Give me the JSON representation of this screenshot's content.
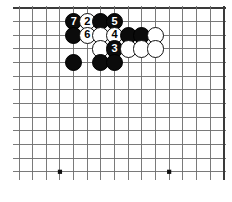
{
  "diagram": {
    "type": "go-board-corner-diagram",
    "caption": "",
    "board": {
      "columns": 16,
      "rows": 13,
      "origin_x": 19,
      "origin_y": 8,
      "spacing": 13.65,
      "line_color": "#6b6b6b",
      "edge_color": "#3a3a3a",
      "line_width": 0.9,
      "edge_width": 2.2,
      "background": "#ffffff",
      "star_points": [
        {
          "col": 3,
          "row": 12
        },
        {
          "col": 11,
          "row": 12
        }
      ],
      "star_radius": 2.1,
      "star_color": "#111111"
    },
    "stone_radius": 8.6,
    "colors": {
      "black": "#0b0b0b",
      "white": "#ffffff",
      "black_label": "#ffffff",
      "white_label": "#000000"
    },
    "stones": [
      {
        "col": 4,
        "row": 1,
        "color": "black",
        "label": "7"
      },
      {
        "col": 5,
        "row": 1,
        "color": "white",
        "label": "2"
      },
      {
        "col": 6,
        "row": 1,
        "color": "black",
        "label": ""
      },
      {
        "col": 7,
        "row": 1,
        "color": "black",
        "label": "5"
      },
      {
        "col": 4,
        "row": 2,
        "color": "black",
        "label": ""
      },
      {
        "col": 5,
        "row": 2,
        "color": "white",
        "label": "6"
      },
      {
        "col": 6,
        "row": 2,
        "color": "white",
        "label": ""
      },
      {
        "col": 7,
        "row": 2,
        "color": "white",
        "label": "4"
      },
      {
        "col": 8,
        "row": 2,
        "color": "black",
        "label": ""
      },
      {
        "col": 9,
        "row": 2,
        "color": "black",
        "label": ""
      },
      {
        "col": 10,
        "row": 2,
        "color": "white",
        "label": ""
      },
      {
        "col": 6,
        "row": 3,
        "color": "white",
        "label": ""
      },
      {
        "col": 7,
        "row": 3,
        "color": "black",
        "label": "3"
      },
      {
        "col": 8,
        "row": 3,
        "color": "white",
        "label": ""
      },
      {
        "col": 9,
        "row": 3,
        "color": "white",
        "label": ""
      },
      {
        "col": 10,
        "row": 3,
        "color": "white",
        "label": ""
      },
      {
        "col": 4,
        "row": 4,
        "color": "black",
        "label": ""
      },
      {
        "col": 6,
        "row": 4,
        "color": "black",
        "label": ""
      },
      {
        "col": 7,
        "row": 4,
        "color": "black",
        "label": ""
      }
    ],
    "move_sequence": [
      {
        "number": "2",
        "color": "white"
      },
      {
        "number": "3",
        "color": "black"
      },
      {
        "number": "4",
        "color": "white"
      },
      {
        "number": "5",
        "color": "black"
      },
      {
        "number": "6",
        "color": "white"
      },
      {
        "number": "7",
        "color": "black"
      }
    ]
  }
}
